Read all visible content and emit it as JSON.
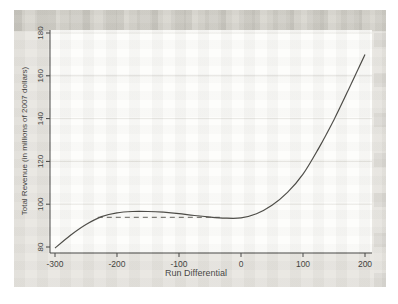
{
  "window": {
    "background": "#ffffff"
  },
  "scan": {
    "background": "#e8e6e1",
    "top_band": "#dcdad3"
  },
  "colors": {
    "axis": "#3a3a38",
    "grid": "#e3e2dc",
    "curve": "#45443f",
    "dash": "#7a7974",
    "text": "#3a3a38",
    "plot_bg": "#fdfdfb"
  },
  "chart_data": {
    "type": "line",
    "title": "",
    "xlabel": "Run Differential",
    "ylabel": "Total Revenue (in millions of 2007 dollars)",
    "xlim": [
      -300,
      200
    ],
    "ylim": [
      80,
      180
    ],
    "x_ticks": [
      -300,
      -200,
      -100,
      0,
      100,
      200
    ],
    "y_ticks": [
      80,
      100,
      120,
      140,
      160,
      180
    ],
    "grid": "horizontal-y",
    "legend": "none",
    "series": [
      {
        "name": "total-revenue-curve",
        "type": "line",
        "style": "solid",
        "x": [
          -300,
          -275,
          -250,
          -225,
          -200,
          -175,
          -150,
          -125,
          -100,
          -75,
          -50,
          -25,
          0,
          25,
          50,
          75,
          100,
          125,
          150,
          175,
          200
        ],
        "y": [
          79.5,
          85.5,
          90.5,
          94.2,
          96,
          96.6,
          96.6,
          96.3,
          95.6,
          94.7,
          94,
          93.5,
          93.6,
          95.5,
          99.5,
          105.5,
          114,
          126,
          139.5,
          154.5,
          170
        ]
      },
      {
        "name": "reference-dashed-line",
        "type": "line",
        "style": "dashed",
        "x": [
          -231,
          -32
        ],
        "y": [
          93.9,
          93.9
        ]
      }
    ]
  }
}
